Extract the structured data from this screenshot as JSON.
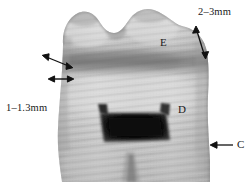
{
  "figure": {
    "width": 251,
    "height": 182,
    "background_color": "#ffffff",
    "modality": "grayscale-sectioned-molar"
  },
  "annotations": {
    "dimensions": [
      {
        "id": "enamel-thickness-occlusal",
        "text": "2–3mm",
        "x": 198,
        "y": 7,
        "arrow": "double-headed",
        "points_to": "occlusal-enamel-layer"
      },
      {
        "id": "enamel-thickness-cervical",
        "text": "1–1.3mm",
        "x": 6,
        "y": 103,
        "arrow": "double-headed",
        "points_to": "lateral-enamel-layer"
      }
    ],
    "structures": [
      {
        "id": "enamel",
        "text": "E",
        "x": 160,
        "y": 37,
        "arrow": "none"
      },
      {
        "id": "dentin",
        "text": "D",
        "x": 178,
        "y": 104,
        "arrow": "none"
      },
      {
        "id": "cementum",
        "text": "C",
        "x": 237,
        "y": 139,
        "arrow": "single-headed-left"
      }
    ]
  },
  "colors": {
    "ink": "#1a1a1a",
    "background": "#ffffff",
    "enamel_light": "#cdcdcd",
    "dentin_mid": "#b4b4b4",
    "pulp_dark": "#171717",
    "shadow_band": "#8d8d8d"
  }
}
